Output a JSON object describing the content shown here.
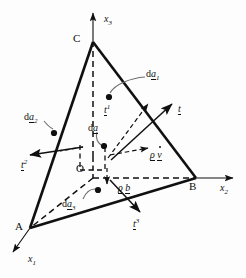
{
  "figure": {
    "stroke_color": "#101010",
    "background": "#fdfdfd"
  },
  "axes": [
    {
      "id": "x1",
      "base": "x",
      "sub": "1",
      "label": "x1"
    },
    {
      "id": "x2",
      "base": "x",
      "sub": "2",
      "label": "x2"
    },
    {
      "id": "x3",
      "base": "x",
      "sub": "3",
      "label": "x3"
    }
  ],
  "vertices": [
    {
      "id": "A",
      "label": "A"
    },
    {
      "id": "B",
      "label": "B"
    },
    {
      "id": "C",
      "label": "C"
    },
    {
      "id": "O",
      "label": "O"
    }
  ],
  "area_labels": [
    {
      "id": "da1",
      "prefix": "d",
      "base": "a",
      "sub": "1"
    },
    {
      "id": "da2",
      "prefix": "d",
      "base": "a",
      "sub": "2"
    },
    {
      "id": "da3",
      "prefix": "d",
      "base": "a",
      "sub": "3"
    },
    {
      "id": "da",
      "prefix": "d",
      "base": "a",
      "sub": ""
    }
  ],
  "traction_vectors": [
    {
      "id": "t",
      "base": "t",
      "sup": ""
    },
    {
      "id": "t1",
      "base": "t",
      "sup": "1"
    },
    {
      "id": "t2",
      "base": "t",
      "sup": "2"
    },
    {
      "id": "t3",
      "base": "t",
      "sup": "3"
    }
  ],
  "field_terms": [
    {
      "id": "rho-vdot",
      "rho": "ρ",
      "base": "v",
      "accent": "dot"
    },
    {
      "id": "rho-b",
      "rho": "ρ",
      "base": "b",
      "accent": "none"
    }
  ],
  "text": {
    "A": "A",
    "B": "B",
    "C": "C",
    "O": "O",
    "x_base": "x",
    "x1_sub": "1",
    "x2_sub": "2",
    "x3_sub": "3",
    "d": "d",
    "a": "a",
    "sub1": "1",
    "sub2": "2",
    "sub3": "3",
    "t": "t",
    "sup1": "1",
    "sup2": "2",
    "sup3": "3",
    "rho": "ρ",
    "v": "v",
    "b": "b"
  }
}
